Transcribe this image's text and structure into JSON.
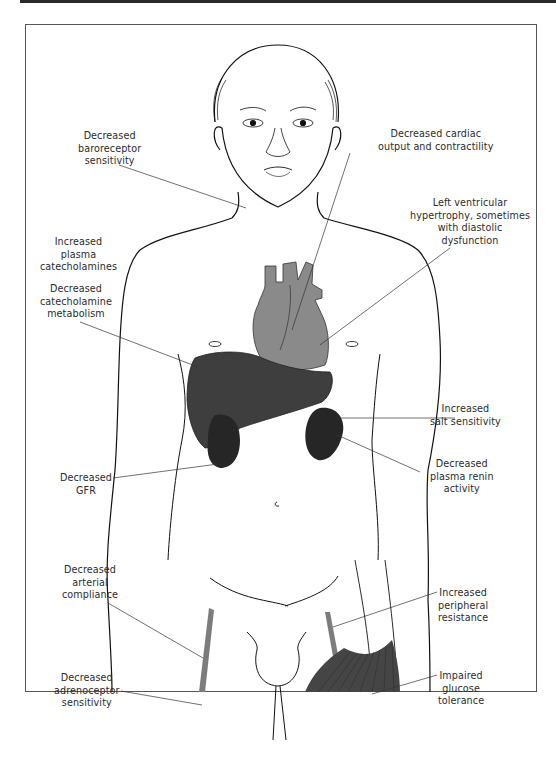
{
  "figure": {
    "colors": {
      "heart": "#8a8a8a",
      "liver": "#3e3e3e",
      "kidney": "#262626",
      "artery": "#7c7c7c",
      "muscle": "#454545",
      "line": "#111111"
    }
  },
  "labels": {
    "baroreceptor": [
      "Decreased",
      "baroreceptor",
      "sensitivity"
    ],
    "cardiac": [
      "Decreased cardiac",
      "output and contractility"
    ],
    "lvh": [
      "Left ventricular",
      "hypertrophy, sometimes",
      "with diastolic",
      "dysfunction"
    ],
    "catecholamines": [
      "Increased",
      "plasma",
      "catecholamines"
    ],
    "catecholamine_metabolism": [
      "Decreased",
      "catecholamine",
      "metabolism"
    ],
    "salt": [
      "Increased",
      "salt sensitivity"
    ],
    "renin": [
      "Decreased",
      "plasma renin",
      "activity"
    ],
    "gfr": [
      "Decreased",
      "GFR"
    ],
    "arterial": [
      "Decreased",
      "arterial",
      "compliance"
    ],
    "peripheral": [
      "Increased",
      "peripheral",
      "resistance"
    ],
    "adrenoceptor": [
      "Decreased",
      "adrenoceptor",
      "sensitivity"
    ],
    "glucose": [
      "Impaired",
      "glucose",
      "tolerance"
    ]
  }
}
